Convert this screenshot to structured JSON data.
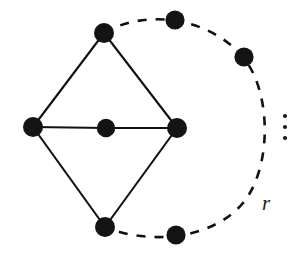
{
  "figure": {
    "background_color": "#ffffff",
    "ink_color": "#141414",
    "width": 299,
    "height": 261
  },
  "arc_label": {
    "text": "r",
    "x": 262,
    "y": 210
  },
  "ellipsis": {
    "name": "vertical-ellipsis",
    "dots": [
      {
        "cx": 285,
        "cy": 116,
        "r": 2.1
      },
      {
        "cx": 285,
        "cy": 127,
        "r": 2.1
      },
      {
        "cx": 285,
        "cy": 138,
        "r": 2.1
      }
    ]
  },
  "nodes": [
    {
      "id": "left",
      "label": "left-vertex",
      "cx": 33,
      "cy": 127,
      "r": 10.0
    },
    {
      "id": "top-left",
      "label": "top-left-vertex",
      "cx": 104,
      "cy": 33,
      "r": 10.0
    },
    {
      "id": "center",
      "label": "center-vertex",
      "cx": 106,
      "cy": 128,
      "r": 9.2
    },
    {
      "id": "right",
      "label": "right-vertex",
      "cx": 177,
      "cy": 128,
      "r": 10.0
    },
    {
      "id": "bottom-left",
      "label": "bottom-left-vertex",
      "cx": 105,
      "cy": 227,
      "r": 10.0
    },
    {
      "id": "arc-top",
      "label": "arc-top-vertex",
      "cx": 175,
      "cy": 20,
      "r": 9.6
    },
    {
      "id": "arc-upper-right",
      "label": "arc-upper-right-vertex",
      "cx": 244,
      "cy": 57,
      "r": 9.6
    },
    {
      "id": "arc-bottom",
      "label": "arc-bottom-vertex",
      "cx": 176,
      "cy": 235,
      "r": 9.6
    }
  ],
  "solid_edges": [
    {
      "id": "left-topleft",
      "x1": 33,
      "y1": 127,
      "x2": 104,
      "y2": 33
    },
    {
      "id": "topleft-right",
      "x1": 104,
      "y1": 33,
      "x2": 177,
      "y2": 128
    },
    {
      "id": "left-center",
      "x1": 33,
      "y1": 127,
      "x2": 106,
      "y2": 128
    },
    {
      "id": "center-right",
      "x1": 106,
      "y1": 128,
      "x2": 177,
      "y2": 128
    },
    {
      "id": "left-bottomleft",
      "x1": 33,
      "y1": 127,
      "x2": 105,
      "y2": 227
    },
    {
      "id": "bottomleft-right",
      "x1": 105,
      "y1": 227,
      "x2": 177,
      "y2": 128
    }
  ],
  "dashed_arc": {
    "id": "outer-dashed-arc",
    "path": "M 104 33 C 146 8, 210 18, 243 57 C 272 92, 272 168, 243 203 C 212 240, 148 245, 105 227",
    "dash_pattern": "9 9"
  }
}
